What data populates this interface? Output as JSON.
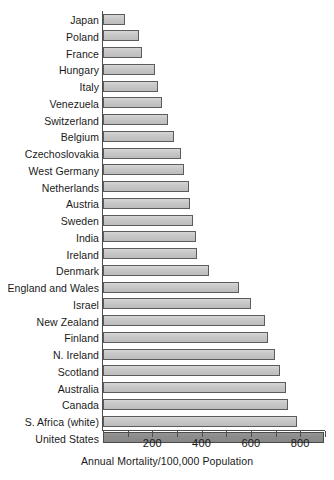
{
  "chart_data": {
    "type": "bar",
    "orientation": "horizontal",
    "title": "",
    "subtitle": "",
    "xlabel": "Annual Mortality/100,000 Population",
    "ylabel": "",
    "xlim": [
      0,
      900
    ],
    "xticks": [
      0,
      200,
      400,
      600,
      800
    ],
    "xtick_labels": [
      "",
      "200",
      "400",
      "600",
      "800"
    ],
    "minor_tick_step": 100,
    "grid": false,
    "legend": "none",
    "categories": [
      "Japan",
      "Poland",
      "France",
      "Hungary",
      "Italy",
      "Venezuela",
      "Switzerland",
      "Belgium",
      "Czechoslovakia",
      "West Germany",
      "Netherlands",
      "Austria",
      "Sweden",
      "India",
      "Ireland",
      "Denmark",
      "England and Wales",
      "Israel",
      "New Zealand",
      "Finland",
      "N. Ireland",
      "Scotland",
      "Australia",
      "Canada",
      "S. Africa (white)",
      "United States"
    ],
    "values": [
      90,
      145,
      160,
      210,
      222,
      240,
      263,
      290,
      315,
      327,
      348,
      354,
      365,
      379,
      381,
      429,
      552,
      602,
      657,
      670,
      697,
      718,
      742,
      749,
      785,
      897
    ],
    "highlighted_category": "United States",
    "bar_color": "#c6c6c6",
    "bar_border_color": "#5c5c5c",
    "highlight_color": "#8c8c8c",
    "axis_color": "#4d4d4d",
    "background_color": "#ffffff"
  }
}
